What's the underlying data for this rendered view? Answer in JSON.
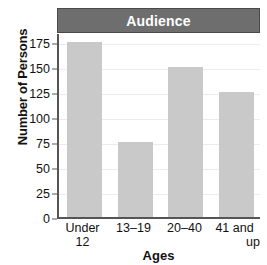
{
  "chart_data": {
    "type": "bar",
    "title": "Audience",
    "xlabel": "Ages",
    "ylabel": "Number of Persons",
    "categories": [
      "Under 12",
      "13–19",
      "20–40",
      "41 and up"
    ],
    "category_lines": [
      [
        "Under",
        "12"
      ],
      [
        "13–19",
        ""
      ],
      [
        "20–40",
        ""
      ],
      [
        "41 and",
        "up"
      ]
    ],
    "values": [
      175,
      75,
      150,
      125
    ],
    "ylim": [
      0,
      185
    ],
    "yticks": [
      0,
      25,
      50,
      75,
      100,
      125,
      150,
      175
    ],
    "ytick_labels": [
      "0",
      "25",
      "50",
      "75",
      "100",
      "125",
      "150",
      "175"
    ],
    "grid": true,
    "legend": false,
    "colors": {
      "bar_fill": "#c9c9c9",
      "title_band": "#6e6e6e",
      "title_text": "#ffffff",
      "axis_line": "#555555",
      "gridline": "#ececec",
      "text": "#111111",
      "background": "#ffffff"
    }
  }
}
